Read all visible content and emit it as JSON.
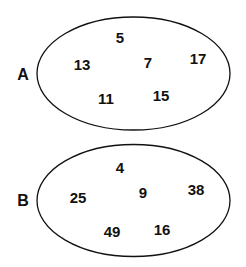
{
  "sets": [
    {
      "name": "A",
      "label_pos": [
        23,
        75
      ],
      "ellipse": {
        "cx": 133.5,
        "cy": 73.5,
        "rx": 96.5,
        "ry": 56.5
      },
      "elements": [
        {
          "value": "5",
          "pos": [
            120,
            37
          ]
        },
        {
          "value": "13",
          "pos": [
            82,
            64
          ]
        },
        {
          "value": "7",
          "pos": [
            148,
            62
          ]
        },
        {
          "value": "17",
          "pos": [
            198,
            58
          ]
        },
        {
          "value": "11",
          "pos": [
            106,
            98
          ]
        },
        {
          "value": "15",
          "pos": [
            161,
            95
          ]
        }
      ]
    },
    {
      "name": "B",
      "label_pos": [
        23,
        201
      ],
      "ellipse": {
        "cx": 133.5,
        "cy": 200.5,
        "rx": 96.5,
        "ry": 56
      },
      "elements": [
        {
          "value": "4",
          "pos": [
            120,
            167
          ]
        },
        {
          "value": "25",
          "pos": [
            78,
            197
          ]
        },
        {
          "value": "9",
          "pos": [
            143,
            192
          ]
        },
        {
          "value": "38",
          "pos": [
            196,
            189
          ]
        },
        {
          "value": "49",
          "pos": [
            112,
            231
          ]
        },
        {
          "value": "16",
          "pos": [
            162,
            229
          ]
        }
      ]
    }
  ],
  "colors": {
    "stroke": "#111111",
    "text": "#111111",
    "background": "#ffffff"
  }
}
